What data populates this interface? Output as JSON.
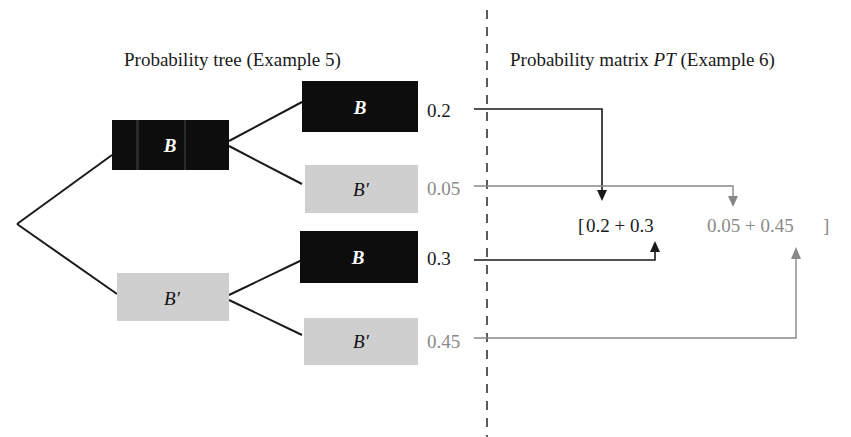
{
  "left_title": "Probability tree (Example 5)",
  "right_title_prefix": "Probability matrix ",
  "right_title_italic": "PT",
  "right_title_suffix": " (Example 6)",
  "colors": {
    "dark_node": "#0d0d0d",
    "light_node": "#cfcfcf",
    "dark_text": "#1a1a1a",
    "light_text": "#8a8a8a",
    "line": "#1a1a1a",
    "gray_line": "#888888"
  },
  "tree": {
    "level1": [
      {
        "label": "B",
        "style": "dark"
      },
      {
        "label": "B′",
        "style": "light"
      }
    ],
    "level2": [
      {
        "label": "B",
        "style": "dark",
        "value": "0.2"
      },
      {
        "label": "B′",
        "style": "light",
        "value": "0.05"
      },
      {
        "label": "B",
        "style": "dark",
        "value": "0.3"
      },
      {
        "label": "B′",
        "style": "light",
        "value": "0.45"
      }
    ]
  },
  "matrix": {
    "open_bracket": "[",
    "left_entry": "0.2 + 0.3",
    "right_entry": "0.05 + 0.45",
    "close_bracket": "]"
  }
}
